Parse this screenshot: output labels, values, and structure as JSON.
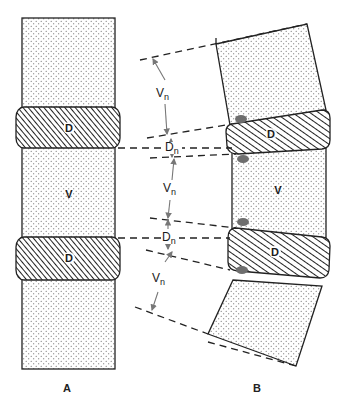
{
  "figure": {
    "panels": [
      {
        "id": "A",
        "caption": "A",
        "description": "Straight spinal segment",
        "labels": {
          "upper_disc": "D",
          "vertebra": "V",
          "lower_disc": "D"
        }
      },
      {
        "id": "B",
        "caption": "B",
        "description": "Flexed spinal segment with wedged discs",
        "labels": {
          "upper_disc": "D",
          "vertebra": "V",
          "lower_disc": "D"
        }
      }
    ],
    "dimensions": [
      {
        "label_main": "V",
        "label_sub": "n"
      },
      {
        "label_main": "D",
        "label_sub": "n"
      },
      {
        "label_main": "V",
        "label_sub": "n"
      },
      {
        "label_main": "D",
        "label_sub": "n"
      },
      {
        "label_main": "V",
        "label_sub": "n"
      }
    ],
    "legend": {
      "vertebra_fill": "stippled",
      "disc_fill": "hatched",
      "compression_marker_color": "#6e6e6e"
    }
  }
}
